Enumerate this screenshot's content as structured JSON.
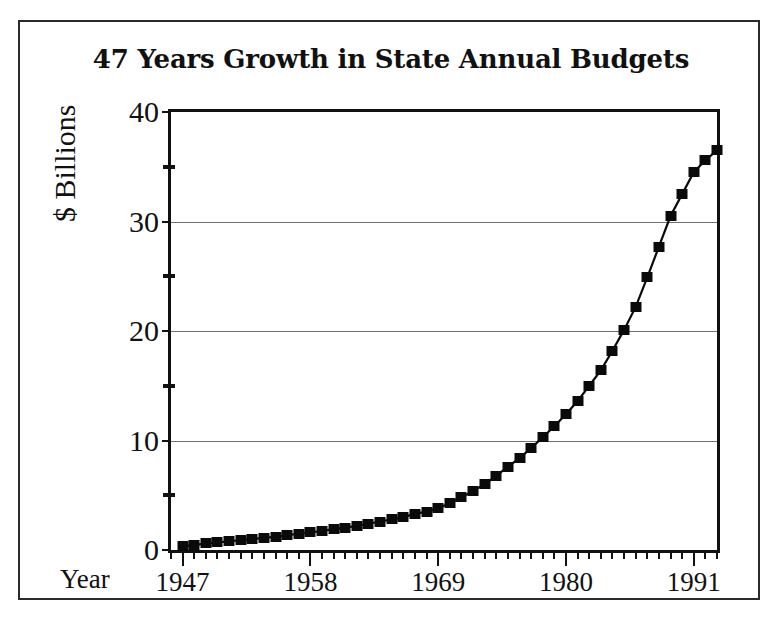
{
  "figure": {
    "title": "47 Years Growth in State Annual Budgets",
    "year_axis_prefix": "Year",
    "frame_color": "#2b2b2b",
    "marker_color": "#0a0a0a",
    "gridline_color": "#6f6f6f"
  },
  "chart_data": {
    "type": "line",
    "title": "47 Years Growth in State Annual Budgets",
    "xlabel": "Year",
    "ylabel": "$ Billions",
    "xlim": [
      1946,
      1993
    ],
    "ylim": [
      0,
      40
    ],
    "grid": true,
    "legend": "none",
    "marker": "filled-square",
    "y_ticks_major": [
      0,
      10,
      20,
      30,
      40
    ],
    "y_ticks_minor": [
      5,
      15,
      25,
      35
    ],
    "x_ticks_major": [
      1947,
      1958,
      1969,
      1980,
      1991
    ],
    "x_tick_labels": [
      "1947",
      "1958",
      "1969",
      "1980",
      "1991"
    ],
    "y_tick_labels": [
      "0",
      "10",
      "20",
      "30",
      "40"
    ],
    "x_tick_step_minor": 1,
    "x": [
      1947,
      1948,
      1949,
      1950,
      1951,
      1952,
      1953,
      1954,
      1955,
      1956,
      1957,
      1958,
      1959,
      1960,
      1961,
      1962,
      1963,
      1964,
      1965,
      1966,
      1967,
      1968,
      1969,
      1970,
      1971,
      1972,
      1973,
      1974,
      1975,
      1976,
      1977,
      1978,
      1979,
      1980,
      1981,
      1982,
      1983,
      1984,
      1985,
      1986,
      1987,
      1988,
      1989,
      1990,
      1991,
      1992,
      1993
    ],
    "values": [
      0.35,
      0.45,
      0.6,
      0.7,
      0.8,
      0.9,
      1.0,
      1.1,
      1.2,
      1.35,
      1.5,
      1.6,
      1.75,
      1.9,
      2.05,
      2.2,
      2.4,
      2.6,
      2.8,
      3.0,
      3.3,
      3.5,
      3.8,
      4.3,
      4.8,
      5.4,
      6.0,
      6.8,
      7.6,
      8.4,
      9.3,
      10.3,
      11.3,
      12.4,
      13.6,
      15.0,
      16.4,
      18.2,
      20.1,
      22.2,
      24.9,
      27.7,
      30.5,
      32.5,
      34.5,
      35.6,
      36.5
    ],
    "series_name": "State Annual Budget",
    "units": "$ Billions",
    "span_years": 47
  }
}
